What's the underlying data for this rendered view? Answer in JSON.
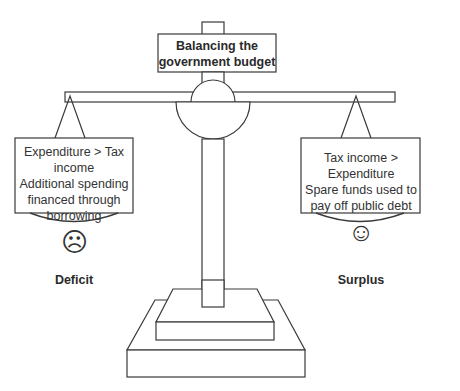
{
  "title": "Balancing the government budget",
  "title_lines": [
    "Balancing the",
    "government budget"
  ],
  "left_pan": {
    "lines": [
      "Expenditure > Tax",
      "income",
      "Additional spending",
      "financed through",
      "borrowing"
    ],
    "face": "☹",
    "face_icon": "sad-face-icon",
    "label": "Deficit"
  },
  "right_pan": {
    "lines": [
      "Tax income >",
      "Expenditure",
      "Spare funds used to",
      "pay off public debt"
    ],
    "face": "☺",
    "face_icon": "happy-face-icon",
    "label": "Surplus"
  },
  "colors": {
    "stroke": "#3a3a3a",
    "text": "#2a2a2a",
    "background": "#ffffff"
  }
}
